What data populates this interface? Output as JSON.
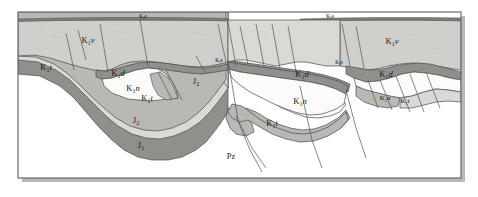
{
  "figure": {
    "type": "geological-cross-section",
    "width": 478,
    "height": 197,
    "frame": {
      "x": 18,
      "y": 12,
      "width": 443,
      "height": 166,
      "border_color": "#6b6b6b",
      "background": "#ffffff",
      "shadow_color": "#b9b9b9"
    }
  },
  "palette": {
    "top_light_gray": "#cfcfcb",
    "light_gray": "#d9d9d5",
    "mid_gray": "#b8b8b4",
    "dark_gray": "#8f8f8c",
    "darker_gray": "#7e7e7b",
    "white_unit": "#fbfbfa",
    "outline": "#4a4a4a",
    "fault_line": "#555555",
    "text": "#1a1a1a"
  },
  "legend_units": [
    {
      "code": "K1v",
      "symbol": "K",
      "index": "1",
      "suffix": "v",
      "color": "#cfcfcb"
    },
    {
      "code": "K1t",
      "symbol": "K",
      "index": "1",
      "suffix": "t",
      "color": "#b8b8b4"
    },
    {
      "code": "K1d",
      "symbol": "K",
      "index": "1",
      "suffix": "d",
      "color": "#8f8f8c"
    },
    {
      "code": "K1n",
      "symbol": "K",
      "index": "1",
      "suffix": "n",
      "color": "#fbfbfa"
    },
    {
      "code": "J2",
      "symbol": "J",
      "index": "2",
      "suffix": "",
      "color": "#d9d9d5"
    },
    {
      "code": "J1",
      "symbol": "J",
      "index": "1",
      "suffix": "",
      "color": "#8f8f8c"
    },
    {
      "code": "Pz",
      "symbol": "Pz",
      "index": "",
      "suffix": "",
      "color": "#ffffff"
    },
    {
      "code": "K2s",
      "symbol": "K",
      "index": "2",
      "suffix": "s",
      "color": "#7e7e7b"
    }
  ],
  "labels": [
    {
      "id": "lbl-k1v-left",
      "symbol": "K",
      "index": "1",
      "suffix": "v",
      "x": 88,
      "y": 43,
      "size": "normal"
    },
    {
      "id": "lbl-k1v-right",
      "symbol": "K",
      "index": "1",
      "suffix": "v",
      "x": 392,
      "y": 44,
      "size": "normal"
    },
    {
      "id": "lbl-k1t-far-left",
      "symbol": "K",
      "index": "1",
      "suffix": "t",
      "x": 46,
      "y": 70,
      "size": "normal"
    },
    {
      "id": "lbl-k1d-left",
      "symbol": "K",
      "index": "1",
      "suffix": "d",
      "x": 118,
      "y": 76,
      "size": "normal"
    },
    {
      "id": "lbl-k1n-left",
      "symbol": "K",
      "index": "1",
      "suffix": "n",
      "x": 133,
      "y": 91,
      "size": "normal"
    },
    {
      "id": "lbl-k1t-left",
      "symbol": "K",
      "index": "1",
      "suffix": "t",
      "x": 147,
      "y": 101,
      "size": "normal"
    },
    {
      "id": "lbl-j2-upper",
      "symbol": "J",
      "index": "2",
      "suffix": "",
      "x": 196,
      "y": 84,
      "size": "normal"
    },
    {
      "id": "lbl-j2-lower",
      "symbol": "J",
      "index": "2",
      "suffix": "",
      "x": 136,
      "y": 123,
      "size": "normal"
    },
    {
      "id": "lbl-j1",
      "symbol": "J",
      "index": "1",
      "suffix": "",
      "x": 141,
      "y": 148,
      "size": "normal"
    },
    {
      "id": "lbl-pz",
      "symbol": "Pz",
      "index": "",
      "suffix": "",
      "x": 231,
      "y": 159,
      "size": "normal"
    },
    {
      "id": "lbl-k1d-center",
      "symbol": "K",
      "index": "1",
      "suffix": "d",
      "x": 302,
      "y": 77,
      "size": "normal"
    },
    {
      "id": "lbl-k1n-center",
      "symbol": "K",
      "index": "1",
      "suffix": "n",
      "x": 300,
      "y": 104,
      "size": "normal"
    },
    {
      "id": "lbl-k1t-center",
      "symbol": "K",
      "index": "1",
      "suffix": "t",
      "x": 272,
      "y": 126,
      "size": "normal"
    },
    {
      "id": "lbl-k1d-right",
      "symbol": "K",
      "index": "1",
      "suffix": "d",
      "x": 386,
      "y": 77,
      "size": "normal"
    },
    {
      "id": "lbl-k1n-right",
      "symbol": "K",
      "index": "1",
      "suffix": "n",
      "x": 385,
      "y": 100,
      "size": "small"
    },
    {
      "id": "lbl-k1t-right",
      "symbol": "K",
      "index": "1",
      "suffix": "t",
      "x": 405,
      "y": 103,
      "size": "small"
    },
    {
      "id": "lbl-k2s-top-left",
      "symbol": "K",
      "index": "2",
      "suffix": "s",
      "x": 143,
      "y": 18,
      "size": "small"
    },
    {
      "id": "lbl-k2s-top-right",
      "symbol": "K",
      "index": "2",
      "suffix": "s",
      "x": 330,
      "y": 18,
      "size": "small"
    },
    {
      "id": "lbl-k2s-mid",
      "symbol": "K",
      "index": "2",
      "suffix": "s",
      "x": 219,
      "y": 62,
      "size": "small"
    },
    {
      "id": "lbl-k2s-mid2",
      "symbol": "K",
      "index": "2",
      "suffix": "s",
      "x": 339,
      "y": 64,
      "size": "small"
    }
  ]
}
